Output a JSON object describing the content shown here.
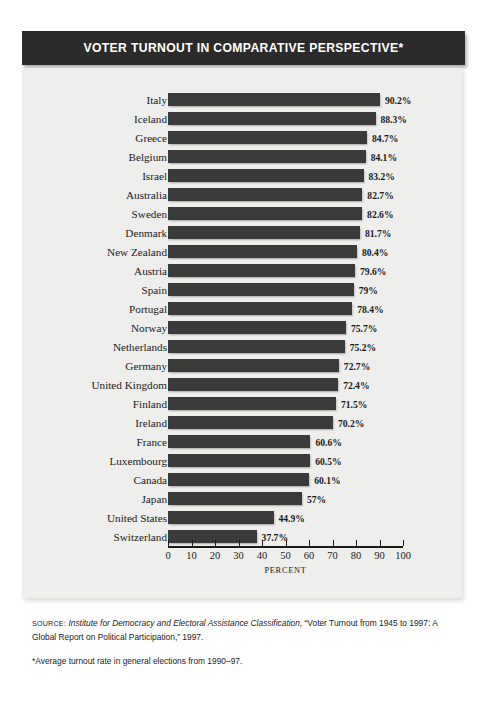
{
  "title": "VOTER TURNOUT IN COMPARATIVE PERSPECTIVE*",
  "source_note": {
    "label": "SOURCE:",
    "italic_part": "Institute for Democracy and Electoral Assistance Classification,",
    "rest": " “Voter Turnout from 1945 to 1997: A Global Report on Political Participation,” 1997."
  },
  "footnote": "*Average turnout rate in general elections from 1990–97.",
  "chart_data": {
    "type": "bar",
    "orientation": "horizontal",
    "title": "VOTER TURNOUT IN COMPARATIVE PERSPECTIVE*",
    "xlabel": "PERCENT",
    "ylabel": "",
    "xlim": [
      0,
      100
    ],
    "xticks": [
      0,
      10,
      20,
      30,
      40,
      50,
      60,
      70,
      80,
      90,
      100
    ],
    "xtick_labels": [
      "0",
      "10",
      "20",
      "30",
      "40",
      "50",
      "60",
      "70",
      "80",
      "90",
      "100"
    ],
    "grid": false,
    "legend": false,
    "bar_color": "#3a3a3a",
    "categories": [
      "Italy",
      "Iceland",
      "Greece",
      "Belgium",
      "Israel",
      "Australia",
      "Sweden",
      "Denmark",
      "New Zealand",
      "Austria",
      "Spain",
      "Portugal",
      "Norway",
      "Netherlands",
      "Germany",
      "United Kingdom",
      "Finland",
      "Ireland",
      "France",
      "Luxembourg",
      "Canada",
      "Japan",
      "United States",
      "Switzerland"
    ],
    "values": [
      90.2,
      88.3,
      84.7,
      84.1,
      83.2,
      82.7,
      82.6,
      81.7,
      80.4,
      79.6,
      79.0,
      78.4,
      75.7,
      75.2,
      72.7,
      72.4,
      71.5,
      70.2,
      60.6,
      60.5,
      60.1,
      57.0,
      44.9,
      37.7
    ],
    "value_labels": [
      "90.2%",
      "88.3%",
      "84.7%",
      "84.1%",
      "83.2%",
      "82.7%",
      "82.6%",
      "81.7%",
      "80.4%",
      "79.6%",
      "79%",
      "78.4%",
      "75.7%",
      "75.2%",
      "72.7%",
      "72.4%",
      "71.5%",
      "70.2%",
      "60.6%",
      "60.5%",
      "60.1%",
      "57%",
      "44.9%",
      "37.7%"
    ]
  }
}
